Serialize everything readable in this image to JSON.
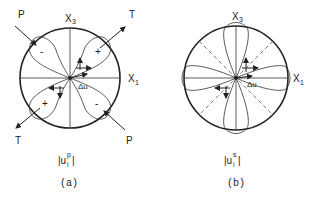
{
  "figure_a": {
    "axis_x3": "X",
    "axis_x3_sub": "3",
    "axis_x1": "X",
    "axis_x1_sub": "1",
    "p_label_top": "P",
    "p_label_bottom": "P",
    "t_label_top": "T",
    "t_label_bottom": "T",
    "lobe_signs": [
      "-",
      "+",
      "+",
      "-"
    ],
    "slip_label": "Δu",
    "amplitude_label": "|u",
    "amplitude_sub": "i",
    "amplitude_sup": "p",
    "amplitude_close": "|",
    "caption": "(a)"
  },
  "figure_b": {
    "axis_x3": "X",
    "axis_x3_sub": "3",
    "axis_x1": "X",
    "axis_x1_sub": "1",
    "slip_label": "Δu",
    "amplitude_label": "|u",
    "amplitude_sub": "i",
    "amplitude_sup": "s",
    "amplitude_close": "|",
    "caption": "(b)"
  }
}
